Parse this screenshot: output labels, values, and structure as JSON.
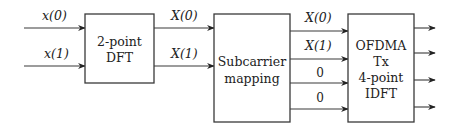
{
  "diagram": {
    "inputs": [
      {
        "label": "x(0)"
      },
      {
        "label": "x(1)"
      }
    ],
    "dft_block": {
      "line1": "2-point",
      "line2": "DFT"
    },
    "dft_outputs": [
      {
        "label": "X(0)"
      },
      {
        "label": "X(1)"
      }
    ],
    "mapping_block": {
      "line1": "Subcarrier",
      "line2": "mapping"
    },
    "mapping_outputs": [
      {
        "label": "X(0)"
      },
      {
        "label": "X(1)"
      },
      {
        "label": "0"
      },
      {
        "label": "0"
      }
    ],
    "idft_block": {
      "line1": "OFDMA",
      "line2": "Tx",
      "line3": "4-point",
      "line4": "IDFT"
    },
    "idft_output_count": 4,
    "colors": {
      "stroke": "#3a3a3a",
      "text": "#222222",
      "background": "#ffffff"
    }
  }
}
